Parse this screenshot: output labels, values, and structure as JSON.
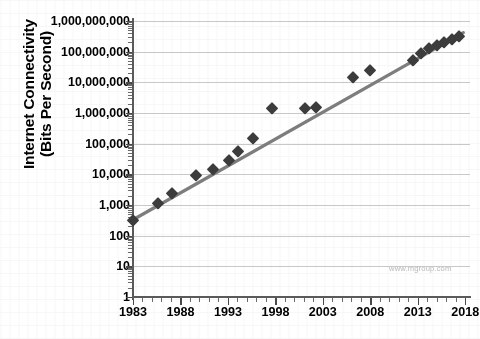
{
  "chart_data": {
    "type": "scatter",
    "title": "",
    "xlabel": "",
    "ylabel": "Internet Connectivity (Bits Per Second)",
    "ylabel_line1": "Internet Connectivity",
    "ylabel_line2": "(Bits Per Second)",
    "yscale": "log",
    "ylim": [
      1,
      1000000000
    ],
    "xlim": [
      1983,
      2018.5
    ],
    "grid": true,
    "legend": null,
    "xticks": [
      1983,
      1988,
      1993,
      1998,
      2003,
      2008,
      2013,
      2018
    ],
    "xticklabels": [
      "1983",
      "1988",
      "1993",
      "1998",
      "2003",
      "2008",
      "2013",
      "2018"
    ],
    "yticks": [
      1,
      10,
      100,
      1000,
      10000,
      100000,
      1000000,
      10000000,
      100000000,
      1000000000
    ],
    "yticklabels": [
      "1",
      "10",
      "100",
      "1,000",
      "10,000",
      "100,000",
      "1,000,000",
      "10,000,000",
      "100,000,000",
      "1,000,000,000"
    ],
    "x": [
      1983.0,
      1985.6,
      1987.1,
      1989.6,
      1991.4,
      1993.1,
      1994.1,
      1995.6,
      1997.6,
      2001.1,
      2002.3,
      2006.2,
      2008.0,
      2012.5,
      2013.3,
      2014.2,
      2015.0,
      2015.8,
      2016.6,
      2017.3
    ],
    "values": [
      330,
      1200,
      2400,
      9600,
      14400,
      28800,
      56000,
      150000,
      1500000,
      1500000,
      1600000,
      15000000,
      26000000,
      55000000,
      90000000,
      130000000,
      160000000,
      200000000,
      260000000,
      320000000
    ],
    "series": [
      {
        "name": "Internet connectivity",
        "marker": "diamond",
        "color": "#3c3c3c",
        "points": [
          {
            "x": 1983.0,
            "y": 330
          },
          {
            "x": 1985.6,
            "y": 1200
          },
          {
            "x": 1987.1,
            "y": 2400
          },
          {
            "x": 1989.6,
            "y": 9600
          },
          {
            "x": 1991.4,
            "y": 14400
          },
          {
            "x": 1993.1,
            "y": 28800
          },
          {
            "x": 1994.1,
            "y": 56000
          },
          {
            "x": 1995.6,
            "y": 150000
          },
          {
            "x": 1997.6,
            "y": 1500000
          },
          {
            "x": 2001.1,
            "y": 1500000
          },
          {
            "x": 2002.3,
            "y": 1600000
          },
          {
            "x": 2006.2,
            "y": 15000000
          },
          {
            "x": 2008.0,
            "y": 26000000
          },
          {
            "x": 2012.5,
            "y": 55000000
          },
          {
            "x": 2013.3,
            "y": 90000000
          },
          {
            "x": 2014.2,
            "y": 130000000
          },
          {
            "x": 2015.0,
            "y": 160000000
          },
          {
            "x": 2015.8,
            "y": 200000000
          },
          {
            "x": 2016.6,
            "y": 260000000
          },
          {
            "x": 2017.3,
            "y": 320000000
          }
        ]
      }
    ],
    "trendline": {
      "name": "trend",
      "color": "#7d7d7d",
      "start": {
        "x": 1983.0,
        "y": 330
      },
      "end": {
        "x": 2017.8,
        "y": 420000000
      }
    },
    "annotations": [
      {
        "name": "watermark",
        "text": "www.mgroup.com",
        "color": "#b9b9b9"
      }
    ]
  },
  "watermark": {
    "text": "www.mgroup.com"
  }
}
